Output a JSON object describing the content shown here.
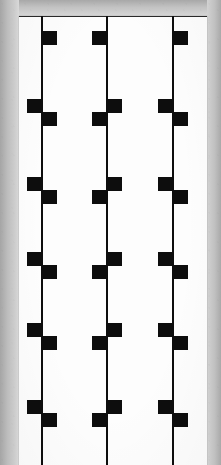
{
  "document": {
    "title": "Scanned sheet with three vertical stems and square marks",
    "canvas_width": 221,
    "canvas_height": 465,
    "background_color": "#d8d8d8",
    "paper_color": "#fdfdfd",
    "ink_color": "#0d0d0d",
    "scan_border_color": "#b0b0b0"
  },
  "paper": {
    "left": 19,
    "top": 16,
    "width": 188,
    "height": 449,
    "top_rule_visible": true
  },
  "marks": {
    "square_size": 14,
    "stem_width": 2,
    "left_offset": -14,
    "right_offset": 2,
    "description": "Square blocks attach alternately to the left and right side of each stem, in vertically stacked pairs."
  },
  "stems": [
    {
      "name": "stem-1",
      "x": 41,
      "top": 16,
      "bottom": 465,
      "marks": [
        {
          "y": 31,
          "side": "right"
        },
        {
          "y": 99,
          "side": "left"
        },
        {
          "y": 112,
          "side": "right"
        },
        {
          "y": 177,
          "side": "left"
        },
        {
          "y": 190,
          "side": "right"
        },
        {
          "y": 252,
          "side": "left"
        },
        {
          "y": 265,
          "side": "right"
        },
        {
          "y": 323,
          "side": "left"
        },
        {
          "y": 336,
          "side": "right"
        },
        {
          "y": 400,
          "side": "left"
        },
        {
          "y": 413,
          "side": "right"
        }
      ]
    },
    {
      "name": "stem-2",
      "x": 106,
      "top": 16,
      "bottom": 465,
      "marks": [
        {
          "y": 31,
          "side": "left"
        },
        {
          "y": 99,
          "side": "right"
        },
        {
          "y": 112,
          "side": "left"
        },
        {
          "y": 177,
          "side": "right"
        },
        {
          "y": 190,
          "side": "left"
        },
        {
          "y": 252,
          "side": "right"
        },
        {
          "y": 265,
          "side": "left"
        },
        {
          "y": 323,
          "side": "right"
        },
        {
          "y": 336,
          "side": "left"
        },
        {
          "y": 400,
          "side": "right"
        },
        {
          "y": 413,
          "side": "left"
        }
      ]
    },
    {
      "name": "stem-3",
      "x": 172,
      "top": 16,
      "bottom": 465,
      "marks": [
        {
          "y": 31,
          "side": "right"
        },
        {
          "y": 99,
          "side": "left"
        },
        {
          "y": 112,
          "side": "right"
        },
        {
          "y": 177,
          "side": "left"
        },
        {
          "y": 190,
          "side": "right"
        },
        {
          "y": 252,
          "side": "left"
        },
        {
          "y": 265,
          "side": "right"
        },
        {
          "y": 323,
          "side": "left"
        },
        {
          "y": 336,
          "side": "right"
        },
        {
          "y": 400,
          "side": "left"
        },
        {
          "y": 413,
          "side": "right"
        }
      ]
    }
  ]
}
